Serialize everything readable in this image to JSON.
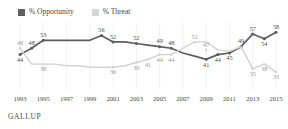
{
  "legend": {
    "position": "top-left",
    "items": [
      {
        "label": "% Opportunity",
        "color": "#5e5e5e",
        "icon": "square-swatch"
      },
      {
        "label": "% Threat",
        "color": "#d6d6d6",
        "icon": "square-swatch"
      }
    ]
  },
  "footer": {
    "source": "GALLUP"
  },
  "chart_data": {
    "type": "line",
    "title": "",
    "subtitle": "",
    "xlabel": "",
    "ylabel": "",
    "grid": "vertical-only",
    "legend_position": "top-left",
    "ylim": [
      28,
      62
    ],
    "xlim": [
      1993,
      2015
    ],
    "tick_labels": [
      "1993",
      "1995",
      "1997",
      "1999",
      "2001",
      "2003",
      "2005",
      "2007",
      "2009",
      "2011",
      "2013",
      "2015"
    ],
    "x": [
      1993,
      1994,
      1995,
      1996,
      1997,
      1998,
      1999,
      2000,
      2001,
      2002,
      2003,
      2004,
      2005,
      2006,
      2007,
      2008,
      2009,
      2010,
      2011,
      2012,
      2013,
      2014,
      2015
    ],
    "series": [
      {
        "name": "% Opportunity",
        "color": "#5e5e5e",
        "values": [
          44,
          48,
          53,
          53,
          53,
          53,
          53,
          56,
          52,
          52,
          51,
          50,
          49,
          48,
          45,
          43,
          41,
          44,
          45,
          49,
          57,
          54,
          58
        ],
        "labels": [
          {
            "x": 1993,
            "value": 44,
            "text": "44",
            "pos": "below"
          },
          {
            "x": 1994,
            "value": 48,
            "text": "48",
            "pos": "above"
          },
          {
            "x": 1995,
            "value": 53,
            "text": "53",
            "pos": "above"
          },
          {
            "x": 2000,
            "value": 56,
            "text": "56",
            "pos": "above"
          },
          {
            "x": 2001,
            "value": 52,
            "text": "52",
            "pos": "above"
          },
          {
            "x": 2003,
            "value": 51,
            "text": "52",
            "pos": "above"
          },
          {
            "x": 2005,
            "value": 49,
            "text": "49",
            "pos": "above"
          },
          {
            "x": 2006,
            "value": 48,
            "text": "48",
            "pos": "above"
          },
          {
            "x": 2009,
            "value": 41,
            "text": "41",
            "pos": "below"
          },
          {
            "x": 2010,
            "value": 44,
            "text": "44",
            "pos": "below"
          },
          {
            "x": 2011,
            "value": 45,
            "text": "45",
            "pos": "below"
          },
          {
            "x": 2012,
            "value": 49,
            "text": "49",
            "pos": "above"
          },
          {
            "x": 2013,
            "value": 57,
            "text": "57",
            "pos": "above"
          },
          {
            "x": 2014,
            "value": 54,
            "text": "54",
            "pos": "below"
          },
          {
            "x": 2015,
            "value": 58,
            "text": "58",
            "pos": "above"
          }
        ]
      },
      {
        "name": "% Threat",
        "color": "#d2d2d2",
        "values": [
          48,
          38,
          38,
          38,
          37,
          37,
          36,
          36,
          36,
          37,
          39,
          41,
          44,
          44,
          48,
          52,
          52,
          47,
          46,
          49,
          35,
          38,
          33
        ],
        "labels": [
          {
            "x": 1993,
            "value": 48,
            "text": "48",
            "pos": "above"
          },
          {
            "x": 1995,
            "value": 38,
            "text": "38",
            "pos": "below"
          },
          {
            "x": 2001,
            "value": 36,
            "text": "36",
            "pos": "below"
          },
          {
            "x": 2003,
            "value": 39,
            "text": "39",
            "pos": "below"
          },
          {
            "x": 2004,
            "value": 41,
            "text": "41",
            "pos": "below"
          },
          {
            "x": 2005,
            "value": 44,
            "text": "44",
            "pos": "below"
          },
          {
            "x": 2006,
            "value": 44,
            "text": "44",
            "pos": "below"
          },
          {
            "x": 2008,
            "value": 52,
            "text": "52",
            "pos": "above"
          },
          {
            "x": 2009,
            "value": 47,
            "text": "47",
            "pos": "above"
          },
          {
            "x": 2013,
            "value": 35,
            "text": "35",
            "pos": "below"
          },
          {
            "x": 2014,
            "value": 38,
            "text": "38",
            "pos": "below"
          },
          {
            "x": 2015,
            "value": 33,
            "text": "33",
            "pos": "below"
          }
        ]
      }
    ]
  }
}
